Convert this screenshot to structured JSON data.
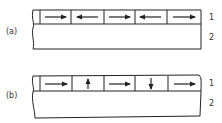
{
  "panels": [
    {
      "label": "(a)",
      "layer_labels": [
        "1",
        "2"
      ],
      "cells": [
        "right",
        "left",
        "right",
        "left",
        "right"
      ]
    },
    {
      "label": "(b)",
      "layer_labels": [
        "1",
        "2"
      ],
      "cells": [
        "right",
        "up",
        "right",
        "down",
        "right"
      ]
    }
  ],
  "colors": {
    "line": "#222222",
    "background": "#ffffff"
  }
}
